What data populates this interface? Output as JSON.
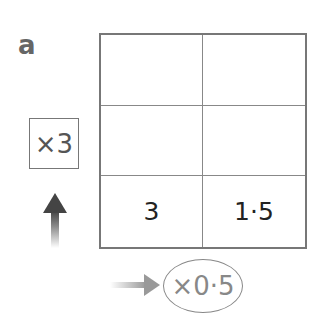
{
  "label": "a",
  "grid": {
    "rows": [
      [
        "",
        ""
      ],
      [
        "",
        ""
      ],
      [
        "3",
        "1·5"
      ]
    ]
  },
  "vertical_operation": "×3",
  "horizontal_operation": "×0·5",
  "colors": {
    "grid_border": "#777777",
    "arrow_dark": "#444444",
    "arrow_gray": "#999999"
  }
}
